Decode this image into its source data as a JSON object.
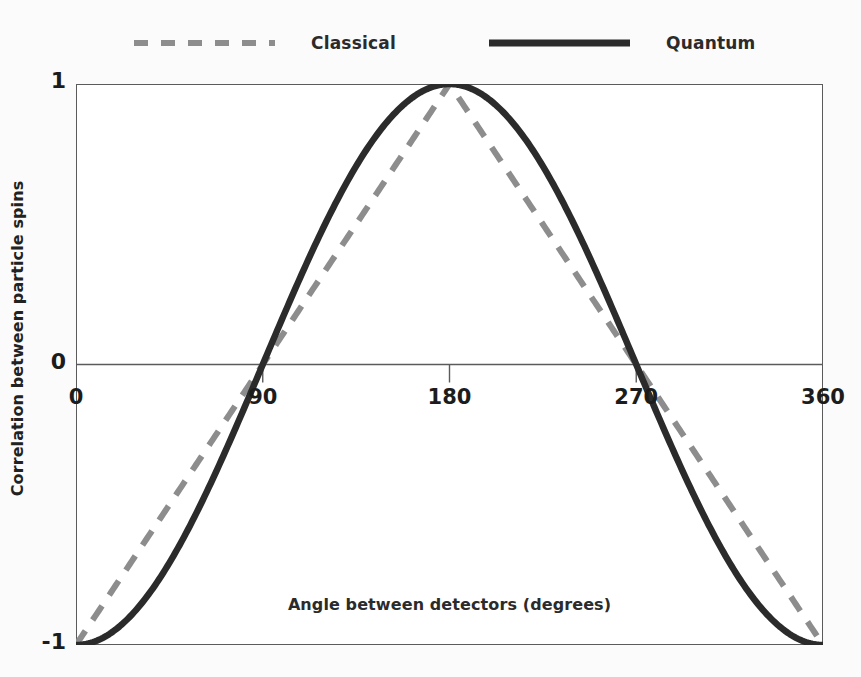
{
  "legend": {
    "position": "top",
    "entries": [
      {
        "label": "Classical",
        "style": "dashed",
        "color": "#8d8d8d",
        "swatch_icon": "dashed-line-icon"
      },
      {
        "label": "Quantum",
        "style": "solid",
        "color": "#2b2b2b",
        "swatch_icon": "solid-line-icon"
      }
    ]
  },
  "axes": {
    "xlabel": "Angle between detectors (degrees)",
    "ylabel": "Correlation between particle spins",
    "xticks": [
      "0",
      "90",
      "180",
      "270",
      "360"
    ],
    "yticks": [
      "1",
      "0",
      "-1"
    ]
  },
  "colors": {
    "classical": "#8d8d8d",
    "quantum": "#2b2b2b",
    "frame": "#5b5b5b",
    "zero_line": "#5b5b5b",
    "background": "#fbfbfb",
    "plot_background": "#ffffff"
  },
  "chart_data": {
    "type": "line",
    "title": "",
    "subtitle": "",
    "xlabel": "Angle between detectors (degrees)",
    "ylabel": "Correlation between particle spins",
    "xlim": [
      0,
      360
    ],
    "ylim": [
      -1,
      1
    ],
    "xticks": [
      0,
      90,
      180,
      270,
      360
    ],
    "yticks": [
      -1,
      0,
      1
    ],
    "grid": false,
    "legend_position": "top",
    "zero_line": true,
    "x": [
      0,
      15,
      30,
      45,
      60,
      75,
      90,
      105,
      120,
      135,
      150,
      165,
      180,
      195,
      210,
      225,
      240,
      255,
      270,
      285,
      300,
      315,
      330,
      345,
      360
    ],
    "series": [
      {
        "name": "Classical",
        "style": "dashed",
        "color": "#8d8d8d",
        "formula": "triangle wave: -1 + 2*x/180 for 0<=x<=180, 3 - 2*x/180 for 180<x<=360",
        "values": [
          -1,
          -0.833,
          -0.667,
          -0.5,
          -0.333,
          -0.167,
          0,
          0.167,
          0.333,
          0.5,
          0.667,
          0.833,
          1,
          0.833,
          0.667,
          0.5,
          0.333,
          0.167,
          0,
          -0.167,
          -0.333,
          -0.5,
          -0.667,
          -0.833,
          -1
        ]
      },
      {
        "name": "Quantum",
        "style": "solid",
        "color": "#2b2b2b",
        "formula": "-cos(x)",
        "values": [
          -1,
          -0.966,
          -0.866,
          -0.707,
          -0.5,
          -0.259,
          0,
          0.259,
          0.5,
          0.707,
          0.866,
          0.966,
          1,
          0.966,
          0.866,
          0.707,
          0.5,
          0.259,
          0,
          -0.259,
          -0.5,
          -0.707,
          -0.866,
          -0.966,
          -1
        ]
      }
    ],
    "annotations": [
      {
        "text": "Both curves cross zero at 90 and 270 degrees"
      },
      {
        "text": "Both curves peak at +1 at 180 degrees"
      },
      {
        "text": "Both curves equal -1 at 0 and 360 degrees"
      }
    ]
  }
}
